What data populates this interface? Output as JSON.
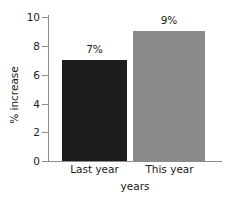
{
  "chart_data": {
    "type": "bar",
    "title": "",
    "subtitle": "",
    "xlabel": "years",
    "ylabel": "% increase",
    "categories": [
      "Last year",
      "This year"
    ],
    "values": [
      7,
      9
    ],
    "data_labels": [
      "7%",
      "9%"
    ],
    "ylim": [
      0,
      10
    ],
    "yticks": [
      0,
      2,
      4,
      6,
      8,
      10
    ],
    "ytick_labels": [
      "0",
      "2",
      "4",
      "6",
      "8",
      "10"
    ],
    "grid": false,
    "legend": false,
    "legend_position": "none",
    "bar_colors": [
      "#1c1c1c",
      "#8a8a8a"
    ],
    "background_color": "#ffffff",
    "axis_color": "#8c8c8c",
    "text_color": "#1a1a1a"
  }
}
